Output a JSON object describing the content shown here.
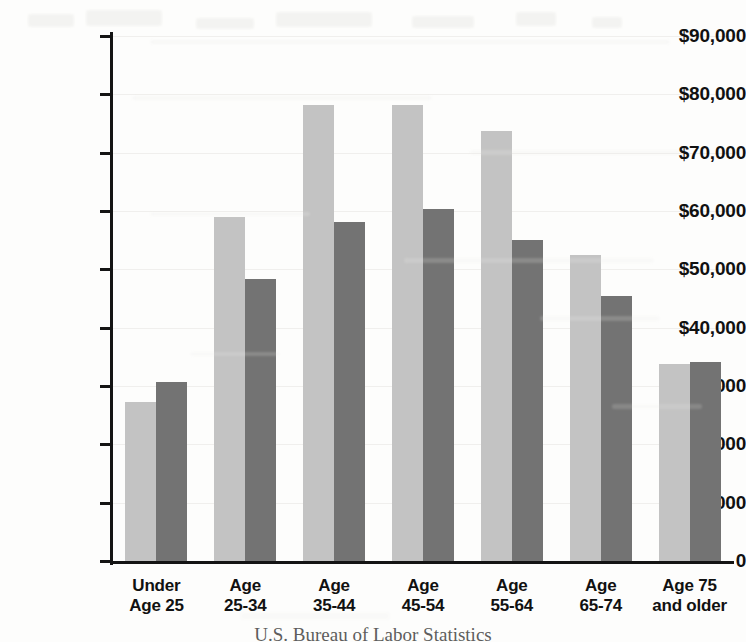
{
  "source_note": "U.S. Bureau of Labor Statistics",
  "chart_data": {
    "type": "bar",
    "title": "",
    "xlabel": "",
    "ylabel": "",
    "ylim": [
      0,
      90000
    ],
    "grid": true,
    "legend": "none",
    "orientation": "vertical",
    "grouping": "grouped",
    "categories": [
      "Under Age 25",
      "Age 25-34",
      "Age 35-44",
      "Age 45-54",
      "Age 55-64",
      "Age 65-74",
      "Age 75 and older"
    ],
    "category_lines": [
      [
        "Under",
        "Age 25"
      ],
      [
        "Age",
        "25-34"
      ],
      [
        "Age",
        "35-44"
      ],
      [
        "Age",
        "45-54"
      ],
      [
        "Age",
        "55-64"
      ],
      [
        "Age",
        "65-74"
      ],
      [
        "Age 75",
        "and older"
      ]
    ],
    "ytick_labels": [
      "$90,000",
      "$80,000",
      "$70,000",
      "$60,000",
      "$50,000",
      "$40,000",
      "$30,000",
      "$20,000",
      "$10,000",
      "0"
    ],
    "ytick_values": [
      90000,
      80000,
      70000,
      60000,
      50000,
      40000,
      30000,
      20000,
      10000,
      0
    ],
    "series": [
      {
        "name": "series-1",
        "color": "#c3c3c3",
        "values": [
          27200,
          59000,
          78200,
          78200,
          73800,
          52500,
          33800
        ]
      },
      {
        "name": "series-2",
        "color": "#737373",
        "values": [
          30700,
          48400,
          58200,
          60300,
          55100,
          45500,
          34200
        ]
      }
    ]
  }
}
